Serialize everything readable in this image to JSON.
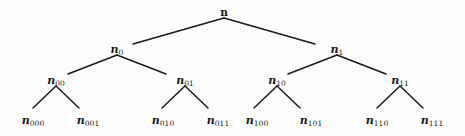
{
  "diagram": {
    "background_color": "#fdfdfd",
    "line_color": "#1a1a1e",
    "text_color": "#16161a",
    "nodes": [
      {
        "id": "root",
        "base": "n",
        "sub": "",
        "x": 224,
        "y": 11,
        "level": 0
      },
      {
        "id": "n0",
        "base": "n",
        "sub": "0",
        "x": 117,
        "y": 48,
        "level": 1
      },
      {
        "id": "n1",
        "base": "n",
        "sub": "1",
        "x": 337,
        "y": 48,
        "level": 1
      },
      {
        "id": "n00",
        "base": "n",
        "sub": "00",
        "x": 56,
        "y": 79,
        "level": 2
      },
      {
        "id": "n01",
        "base": "n",
        "sub": "01",
        "x": 185,
        "y": 79,
        "level": 2
      },
      {
        "id": "n10",
        "base": "n",
        "sub": "10",
        "x": 277,
        "y": 79,
        "level": 2
      },
      {
        "id": "n11",
        "base": "n",
        "sub": "11",
        "x": 400,
        "y": 79,
        "level": 2
      },
      {
        "id": "n000",
        "base": "n",
        "sub": "000",
        "x": 33,
        "y": 119,
        "level": 3
      },
      {
        "id": "n001",
        "base": "n",
        "sub": "001",
        "x": 88,
        "y": 119,
        "level": 3
      },
      {
        "id": "n010",
        "base": "n",
        "sub": "010",
        "x": 163,
        "y": 119,
        "level": 3
      },
      {
        "id": "n011",
        "base": "n",
        "sub": "011",
        "x": 218,
        "y": 119,
        "level": 3
      },
      {
        "id": "n100",
        "base": "n",
        "sub": "100",
        "x": 257,
        "y": 119,
        "level": 3
      },
      {
        "id": "n101",
        "base": "n",
        "sub": "101",
        "x": 311,
        "y": 119,
        "level": 3
      },
      {
        "id": "n110",
        "base": "n",
        "sub": "110",
        "x": 377,
        "y": 119,
        "level": 3
      },
      {
        "id": "n111",
        "base": "n",
        "sub": "111",
        "x": 432,
        "y": 119,
        "level": 3
      }
    ],
    "edges": [
      {
        "id": "root-n0",
        "x1": 224,
        "y1": 18,
        "x2": 133,
        "y2": 44
      },
      {
        "id": "root-n1",
        "x1": 224,
        "y1": 18,
        "x2": 315,
        "y2": 44
      },
      {
        "id": "n0-n00",
        "x1": 117,
        "y1": 55,
        "x2": 68,
        "y2": 74
      },
      {
        "id": "n0-n01",
        "x1": 117,
        "y1": 55,
        "x2": 166,
        "y2": 74
      },
      {
        "id": "n1-n10",
        "x1": 337,
        "y1": 55,
        "x2": 288,
        "y2": 74
      },
      {
        "id": "n1-n11",
        "x1": 337,
        "y1": 55,
        "x2": 386,
        "y2": 74
      },
      {
        "id": "n00-n000",
        "x1": 56,
        "y1": 86,
        "x2": 33,
        "y2": 108
      },
      {
        "id": "n00-n001",
        "x1": 56,
        "y1": 86,
        "x2": 79,
        "y2": 108
      },
      {
        "id": "n01-n010",
        "x1": 185,
        "y1": 86,
        "x2": 162,
        "y2": 108
      },
      {
        "id": "n01-n011",
        "x1": 185,
        "y1": 86,
        "x2": 208,
        "y2": 108
      },
      {
        "id": "n10-n100",
        "x1": 277,
        "y1": 86,
        "x2": 254,
        "y2": 108
      },
      {
        "id": "n10-n101",
        "x1": 277,
        "y1": 86,
        "x2": 300,
        "y2": 108
      },
      {
        "id": "n11-n110",
        "x1": 400,
        "y1": 86,
        "x2": 377,
        "y2": 108
      },
      {
        "id": "n11-n111",
        "x1": 400,
        "y1": 86,
        "x2": 423,
        "y2": 108
      }
    ]
  }
}
